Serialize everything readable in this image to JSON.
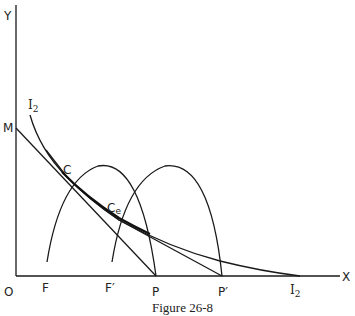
{
  "figure": {
    "caption": "Figure 26-8",
    "axes": {
      "y_label": "Y",
      "x_label": "X",
      "origin_label": "O"
    },
    "points": {
      "M": "M",
      "C": "C",
      "Ce_main": "C",
      "Ce_sub": "e",
      "P": "P",
      "P_prime": "P′",
      "F": "F",
      "F_prime": "F′"
    },
    "curves": {
      "indifference_top": {
        "main": "I",
        "sub": "2"
      },
      "indifference_bottom": {
        "main": "I",
        "sub": "2"
      }
    },
    "colors": {
      "ink": "#1a1a1a",
      "background": "#ffffff"
    }
  }
}
